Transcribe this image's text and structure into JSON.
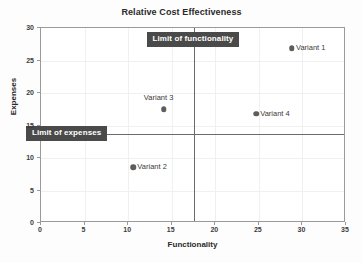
{
  "chart_data": {
    "type": "scatter",
    "title": "Relative Cost Effectiveness",
    "xlabel": "Functionality",
    "ylabel": "Expenses",
    "xlim": [
      0,
      35
    ],
    "ylim": [
      0,
      30
    ],
    "xticks": [
      0,
      5,
      10,
      15,
      20,
      25,
      30,
      35
    ],
    "yticks": [
      0,
      5,
      10,
      15,
      20,
      25,
      30
    ],
    "grid": true,
    "legend": "none",
    "points": [
      {
        "name": "Variant 1",
        "x": 28.8,
        "y": 26.9,
        "label_position": "right"
      },
      {
        "name": "Variant 2",
        "x": 10.6,
        "y": 8.6,
        "label_position": "right"
      },
      {
        "name": "Variant 3",
        "x": 14.1,
        "y": 17.5,
        "label_position": "above"
      },
      {
        "name": "Variant 4",
        "x": 24.7,
        "y": 16.8,
        "label_position": "right"
      }
    ],
    "reference_lines": [
      {
        "name": "Limit of functionality",
        "orientation": "vertical",
        "value": 17.5
      },
      {
        "name": "Limit of expenses",
        "orientation": "horizontal",
        "value": 13.7
      }
    ],
    "colors": {
      "marker": "#5d5d5d",
      "callout_background": "#4a4a4a",
      "callout_text": "#ffffff",
      "reference_line": "#6b6b6b",
      "axis": "#9a9a9a",
      "grid": "#f0f0f0",
      "text": "#2a2a2a",
      "plot_background": "#ffffff"
    }
  }
}
